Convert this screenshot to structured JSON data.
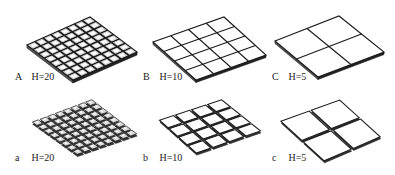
{
  "figure": {
    "panels": [
      {
        "id": "A",
        "letter": "A",
        "caption": "H=20",
        "grid": 8,
        "style": "solid",
        "corners": {
          "left": [
            27,
            45
          ],
          "top": [
            90,
            17
          ],
          "right": [
            137,
            52
          ],
          "bottom": [
            73,
            80
          ]
        },
        "label_pos": [
          15,
          76
        ]
      },
      {
        "id": "B",
        "letter": "B",
        "caption": "H=10",
        "grid": 4,
        "style": "solid",
        "corners": {
          "left": [
            153,
            42
          ],
          "top": [
            224,
            17
          ],
          "right": [
            266,
            55
          ],
          "bottom": [
            196,
            80
          ]
        },
        "label_pos": [
          143,
          76
        ]
      },
      {
        "id": "C",
        "letter": "C",
        "caption": "H=5",
        "grid": 2,
        "style": "solid",
        "corners": {
          "left": [
            275,
            41
          ],
          "top": [
            339,
            16
          ],
          "right": [
            384,
            52
          ],
          "bottom": [
            318,
            77
          ]
        },
        "label_pos": [
          272,
          76
        ]
      },
      {
        "id": "a",
        "letter": "a",
        "caption": "H=20",
        "grid": 8,
        "style": "separated",
        "corners": {
          "left": [
            31,
            122
          ],
          "top": [
            92,
            99
          ],
          "right": [
            138,
            134
          ],
          "bottom": [
            77,
            155
          ]
        },
        "label_pos": [
          15,
          157
        ]
      },
      {
        "id": "b",
        "letter": "b",
        "caption": "H=10",
        "grid": 4,
        "style": "separated",
        "corners": {
          "left": [
            158,
            120
          ],
          "top": [
            222,
            99
          ],
          "right": [
            262,
            131
          ],
          "bottom": [
            196,
            154
          ]
        },
        "label_pos": [
          143,
          157
        ]
      },
      {
        "id": "c",
        "letter": "c",
        "caption": "H=5",
        "grid": 2,
        "style": "separated",
        "corners": {
          "left": [
            279,
            121
          ],
          "top": [
            340,
            99
          ],
          "right": [
            382,
            137
          ],
          "bottom": [
            324,
            162
          ]
        },
        "label_pos": [
          272,
          157
        ]
      }
    ],
    "colors": {
      "line": "#1a1a1a",
      "fill": "#ffffff",
      "shade": "#555555",
      "text": "#222222"
    }
  }
}
